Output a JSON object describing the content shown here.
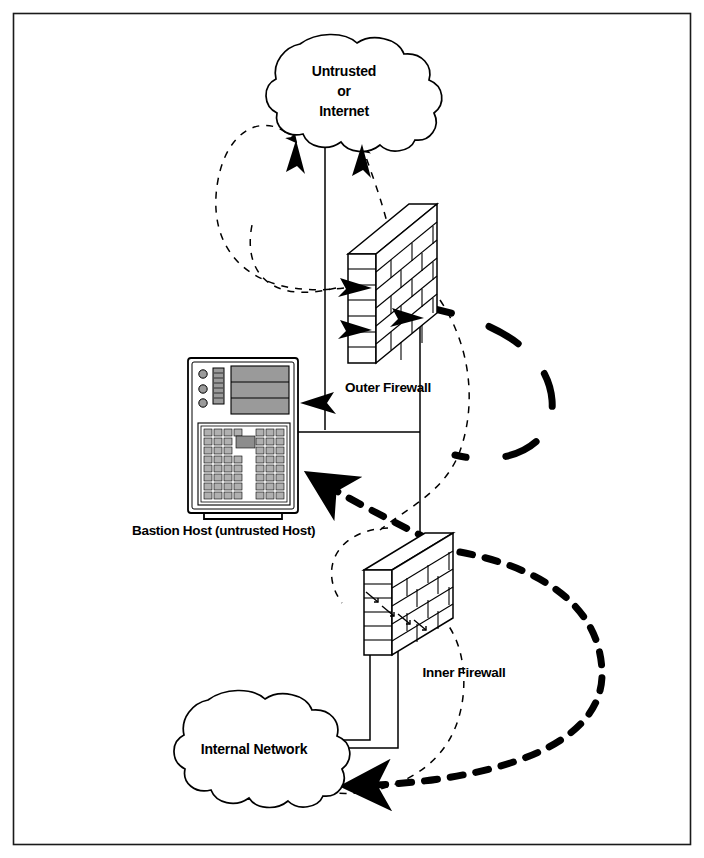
{
  "figure": {
    "type": "network-security-diagram",
    "background_color": "#ffffff",
    "line_color": "#000000",
    "border_color": "#1a1a1a"
  },
  "nodes": {
    "untrusted_cloud": {
      "name": "untrusted-internet-cloud",
      "label_line1": "Untrusted",
      "label_line2": "or",
      "label_line3": "Internet",
      "shape": "cloud"
    },
    "outer_firewall": {
      "name": "outer-firewall",
      "label": "Outer Firewall",
      "shape": "brick-wall-3d"
    },
    "inner_firewall": {
      "name": "inner-firewall",
      "label": "Inner Firewall",
      "shape": "brick-wall-3d"
    },
    "bastion_host": {
      "name": "bastion-host",
      "label": "Bastion Host (untrusted Host)",
      "shape": "terminal-computer",
      "screen_fill": "#9a9a9a",
      "key_fill": "#b0b0b0"
    },
    "internal_cloud": {
      "name": "internal-network-cloud",
      "label": "Internal Network",
      "shape": "cloud"
    }
  },
  "connections": [
    {
      "name": "cloud-to-outer-firewall-solid",
      "style": "solid",
      "from": "untrusted_cloud",
      "to": "outer_firewall"
    },
    {
      "name": "outer-firewall-to-cloud-dashed",
      "style": "thin-dashed",
      "arrow": true,
      "from": "outer_firewall",
      "to": "untrusted_cloud"
    },
    {
      "name": "outer-firewall-loop-left-dashed",
      "style": "thin-dashed",
      "arrow": true,
      "from": "outer_firewall",
      "to": "untrusted_cloud"
    },
    {
      "name": "bastion-to-outer-firewall-solid",
      "style": "solid",
      "from": "bastion_host",
      "to": "outer_firewall"
    },
    {
      "name": "outer-firewall-to-bastion-arrow",
      "style": "solid-arrow",
      "arrow": true,
      "from": "outer_firewall",
      "to": "bastion_host"
    },
    {
      "name": "heavy-dashed-loop-right",
      "style": "thick-dashed",
      "from": "outer_firewall",
      "to": "inner_firewall"
    },
    {
      "name": "inner-firewall-to-bastion-thick-dashed",
      "style": "thick-dashed",
      "arrow": true,
      "from": "inner_firewall",
      "to": "bastion_host"
    },
    {
      "name": "inner-firewall-loop-right-thick-dashed",
      "style": "thick-dashed",
      "arrow": true,
      "from": "inner_firewall",
      "to": "internal_cloud"
    },
    {
      "name": "internal-cloud-to-inner-firewall-solid",
      "style": "solid",
      "from": "internal_cloud",
      "to": "inner_firewall"
    },
    {
      "name": "inner-firewall-thin-dashed-loop",
      "style": "thin-dashed",
      "from": "inner_firewall",
      "to": "internal_cloud"
    }
  ]
}
